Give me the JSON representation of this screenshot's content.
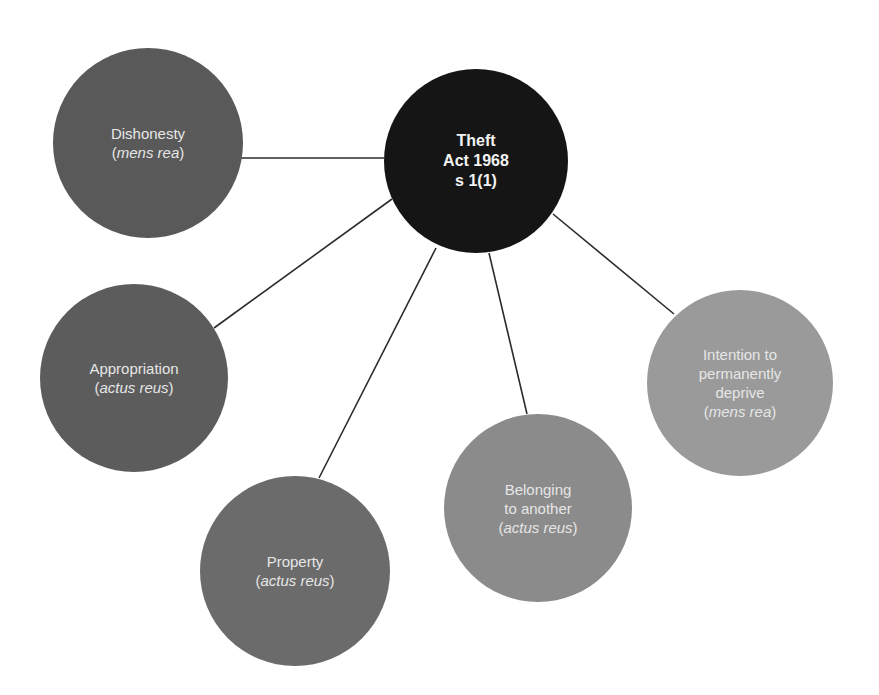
{
  "diagram": {
    "title": "Theft Act 1968 s 1(1)",
    "center": {
      "lines": [
        "Theft",
        "Act 1968",
        "s 1(1)"
      ],
      "cx": 476,
      "cy": 161,
      "r": 92,
      "color": "#151515"
    },
    "nodes": [
      {
        "id": "dishonesty",
        "lines": [
          "Dishonesty"
        ],
        "qualifier": "mens rea",
        "cx": 148,
        "cy": 143,
        "r": 95,
        "color": "#595959",
        "edge": [
          240,
          158,
          384,
          158
        ]
      },
      {
        "id": "appropriation",
        "lines": [
          "Appropriation"
        ],
        "qualifier": "actus reus",
        "cx": 134,
        "cy": 378,
        "r": 94,
        "color": "#5c5c5c",
        "edge": [
          214,
          328,
          392,
          199
        ]
      },
      {
        "id": "property",
        "lines": [
          "Property"
        ],
        "qualifier": "actus reus",
        "cx": 295,
        "cy": 571,
        "r": 95,
        "color": "#6b6b6b",
        "edge": [
          436,
          248,
          319,
          478
        ]
      },
      {
        "id": "belonging",
        "lines": [
          "Belonging",
          "to another"
        ],
        "qualifier": "actus reus",
        "cx": 538,
        "cy": 508,
        "r": 94,
        "color": "#8b8b8b",
        "edge": [
          489,
          253,
          527,
          414
        ]
      },
      {
        "id": "intention",
        "lines": [
          "Intention to",
          "permanently",
          "deprive"
        ],
        "qualifier": "mens rea",
        "cx": 740,
        "cy": 383,
        "r": 93,
        "color": "#9a9a9a",
        "edge": [
          553,
          214,
          674,
          314
        ]
      }
    ],
    "edge_color": "#2b2b2b"
  }
}
